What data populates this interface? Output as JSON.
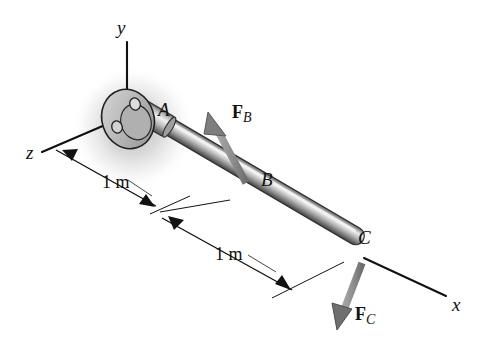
{
  "figure": {
    "background_color": "#ffffff"
  },
  "axes": [
    {
      "name": "y-axis",
      "label": "y",
      "x": 117,
      "y": 18
    },
    {
      "name": "z-axis",
      "label": "z",
      "x": 26,
      "y": 143
    },
    {
      "name": "x-axis",
      "label": "x",
      "x": 452,
      "y": 295
    }
  ],
  "points": [
    {
      "name": "A",
      "label": "A",
      "x": 158,
      "y": 100
    },
    {
      "name": "B",
      "label": "B",
      "x": 261,
      "y": 170
    },
    {
      "name": "C",
      "label": "C",
      "x": 358,
      "y": 228
    }
  ],
  "forces": [
    {
      "name": "F_B",
      "symbol": "F",
      "subscript": "B",
      "x": 232,
      "y": 103
    },
    {
      "name": "F_C",
      "symbol": "F",
      "subscript": "C",
      "x": 355,
      "y": 305
    }
  ],
  "dimensions": [
    {
      "name": "dimension-ab",
      "label": "1 m",
      "x": 102,
      "y": 173
    },
    {
      "name": "dimension-bc",
      "label": "1 m",
      "x": 215,
      "y": 245
    }
  ],
  "colors": {
    "line": "#111111",
    "rod_light": "#e8e8e8",
    "rod_mid": "#9a9a9a",
    "rod_dark": "#4a4a4a",
    "force_arrow": "#8a8a8a",
    "force_arrow_dark": "#5a5a5a",
    "shadow": "#b4b4b4",
    "flange_fill": "#c9c9c9"
  }
}
